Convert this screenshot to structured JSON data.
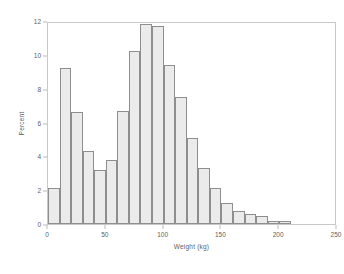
{
  "chart_data": {
    "type": "bar",
    "title": "",
    "subtitle": "",
    "xlabel": "Weight (kg)",
    "ylabel": "Percent",
    "xlim": [
      0,
      250
    ],
    "ylim": [
      0,
      12
    ],
    "xticks": [
      0,
      50,
      100,
      150,
      200,
      250
    ],
    "yticks": [
      0,
      2,
      4,
      6,
      8,
      10,
      12
    ],
    "grid": false,
    "legend": null,
    "bin_width": 10,
    "bin_starts": [
      0,
      10,
      20,
      30,
      40,
      50,
      60,
      70,
      80,
      90,
      100,
      110,
      120,
      130,
      140,
      150,
      160,
      170,
      180,
      190,
      200
    ],
    "categories": [
      "0-10",
      "10-20",
      "20-30",
      "30-40",
      "40-50",
      "50-60",
      "60-70",
      "70-80",
      "80-90",
      "90-100",
      "100-110",
      "110-120",
      "120-130",
      "130-140",
      "140-150",
      "150-160",
      "160-170",
      "170-180",
      "180-190",
      "190-200",
      "200-210"
    ],
    "values": [
      2.1,
      9.2,
      6.6,
      4.3,
      3.2,
      3.8,
      6.7,
      10.2,
      11.8,
      11.7,
      9.4,
      7.5,
      5.1,
      3.3,
      2.1,
      1.25,
      0.75,
      0.6,
      0.45,
      0.2,
      0.15
    ],
    "series": [
      {
        "name": "Percent",
        "values": [
          2.1,
          9.2,
          6.6,
          4.3,
          3.2,
          3.8,
          6.7,
          10.2,
          11.8,
          11.7,
          9.4,
          7.5,
          5.1,
          3.3,
          2.1,
          1.25,
          0.75,
          0.6,
          0.45,
          0.2,
          0.15
        ]
      }
    ],
    "colors": {
      "bar_fill": "#ebebeb",
      "bar_stroke": "#8e8e8e",
      "frame": "#c9c9c9",
      "text": "#606060",
      "background": "#ffffff"
    }
  }
}
